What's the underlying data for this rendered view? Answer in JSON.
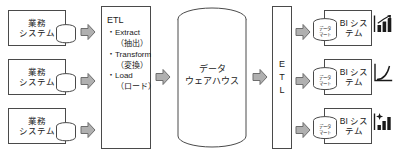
{
  "diagram": {
    "sources": [
      {
        "label_line1": "業務",
        "label_line2": "システム",
        "db_icon": "database-cylinder-icon"
      },
      {
        "label_line1": "業務",
        "label_line2": "システム",
        "db_icon": "database-cylinder-icon"
      },
      {
        "label_line1": "業務",
        "label_line2": "システム",
        "db_icon": "database-cylinder-icon"
      }
    ],
    "etl_process": {
      "title": "ETL",
      "steps": [
        {
          "en": "・Extract",
          "ja": "（抽出）"
        },
        {
          "en": "・Transform",
          "ja": "（変換）"
        },
        {
          "en": "・Load",
          "ja": "（ロード）"
        }
      ]
    },
    "warehouse": {
      "label_line1": "データ",
      "label_line2": "ウェアハウス",
      "shape_icon": "cylinder-icon"
    },
    "etl_secondary": {
      "letters": [
        "E",
        "T",
        "L"
      ]
    },
    "marts": [
      {
        "label_line1": "データ",
        "label_line2": "マート",
        "db_icon": "database-cylinder-icon"
      },
      {
        "label_line1": "データ",
        "label_line2": "マート",
        "db_icon": "database-cylinder-icon"
      },
      {
        "label_line1": "データ",
        "label_line2": "マート",
        "db_icon": "database-cylinder-icon"
      }
    ],
    "bi_systems": [
      {
        "label_line1": "BI",
        "label_line2": "システム",
        "icon": "bar-chart-trend-icon"
      },
      {
        "label_line1": "BI",
        "label_line2": "システム",
        "icon": "line-chart-icon"
      },
      {
        "label_line1": "BI",
        "label_line2": "システム",
        "icon": "bar-chart-star-icon"
      }
    ],
    "arrows": {
      "source_to_etl": "block-arrow-right-icon",
      "etl_to_warehouse": "block-arrow-right-icon",
      "warehouse_to_etl2": "block-arrow-right-icon",
      "etl2_to_mart": "block-arrow-right-icon"
    },
    "colors": {
      "line": "#4a4a4a",
      "arrow_fill": "#b0b0b0",
      "arrow_stroke": "#6e6e6e",
      "background": "#ffffff",
      "text": "#1a1a1a"
    }
  }
}
